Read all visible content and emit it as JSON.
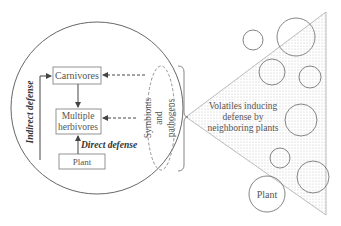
{
  "diagram": {
    "nodes": {
      "carnivores": "Carnivores",
      "multiple_herbivores_line1": "Multiple",
      "multiple_herbivores_line2": "herbivores",
      "plant_inner": "Plant",
      "symbionts_line1": "Symbionts",
      "symbionts_line2": "and",
      "symbionts_line3": "pathogens",
      "volatiles_line1": "Volatiles inducing",
      "volatiles_line2": "defense by",
      "volatiles_line3": "neighboring plants",
      "plant_outer": "Plant"
    },
    "labels": {
      "indirect_defense": "Indirect defense",
      "direct_defense": "Direct defense"
    },
    "edges": [
      {
        "from": "Carnivores",
        "to": "Multiple herbivores",
        "style": "solid"
      },
      {
        "from": "Plant",
        "to": "Multiple herbivores",
        "style": "solid",
        "label": "Direct defense"
      },
      {
        "from": "Plant",
        "to": "Carnivores",
        "style": "solid",
        "label": "Indirect defense"
      },
      {
        "from": "Symbionts and pathogens",
        "to": "Carnivores",
        "style": "dashed"
      },
      {
        "from": "Symbionts and pathogens",
        "to": "Multiple herbivores",
        "style": "dashed"
      }
    ],
    "colors": {
      "stroke": "#666666",
      "text": "#555555",
      "dashed": "#888888",
      "stipple": "#d8d8d8"
    }
  }
}
